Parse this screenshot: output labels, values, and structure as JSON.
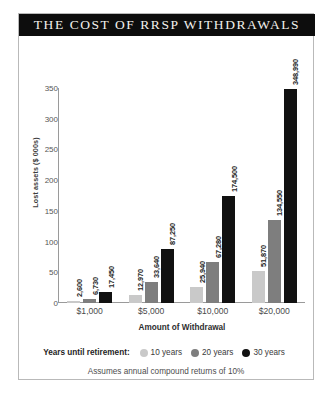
{
  "chart_data": {
    "type": "bar",
    "title": "THE COST OF RRSP WITHDRAWALS",
    "xlabel": "Amount of Withdrawal",
    "ylabel": "Lost assets ($ 000s)",
    "categories": [
      "$1,000",
      "$5,000",
      "$10,000",
      "$20,000"
    ],
    "ylim": [
      0,
      350
    ],
    "yticks": [
      0,
      50,
      100,
      150,
      200,
      250,
      300,
      350
    ],
    "ytick_labels": [
      "0",
      "50",
      "100",
      "150",
      "200",
      "250",
      "300",
      "350"
    ],
    "grid": false,
    "legend_position": "bottom",
    "legend_title": "Years until retirement:",
    "footnote": "Assumes annual compound returns of 10%",
    "value_unit": "dollars",
    "series": [
      {
        "name": "10 years",
        "color": "#c9c9c9",
        "values": [
          2600,
          12970,
          25940,
          51870
        ],
        "labels": [
          "2,600",
          "12,970",
          "25,940",
          "51,870"
        ]
      },
      {
        "name": "20 years",
        "color": "#7e7e7e",
        "values": [
          6730,
          33640,
          67280,
          134550
        ],
        "labels": [
          "6,730",
          "33,640",
          "67,280",
          "134,550"
        ]
      },
      {
        "name": "30 years",
        "color": "#111111",
        "values": [
          17450,
          87250,
          174500,
          348990
        ],
        "labels": [
          "17,450",
          "87,250",
          "174,500",
          "348,990"
        ]
      }
    ]
  }
}
